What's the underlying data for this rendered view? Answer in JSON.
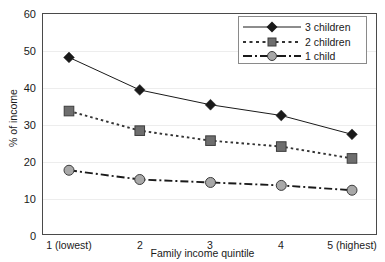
{
  "chart_data": {
    "type": "line",
    "title": "",
    "xlabel": "Family income quintile",
    "ylabel": "% of income",
    "categories": [
      "1 (lowest)",
      "2",
      "3",
      "4",
      "5 (highest)"
    ],
    "ylim": [
      0,
      60
    ],
    "yticks": [
      0,
      10,
      20,
      30,
      40,
      50,
      60
    ],
    "grid": true,
    "legend_position": "top-right",
    "series": [
      {
        "name": "3 children",
        "values": [
          48.0,
          39.2,
          35.2,
          32.3,
          27.2
        ],
        "marker": "diamond",
        "line_style": "solid",
        "color": "#1a1a1a",
        "marker_fill": "#1a1a1a"
      },
      {
        "name": "2 children",
        "values": [
          33.5,
          28.2,
          25.5,
          23.9,
          20.7
        ],
        "marker": "square",
        "line_style": "dotted",
        "color": "#333333",
        "marker_fill": "#6e6e6e"
      },
      {
        "name": "1 child",
        "values": [
          17.5,
          15.0,
          14.2,
          13.4,
          12.1
        ],
        "marker": "circle",
        "line_style": "dash-dot",
        "color": "#1a1a1a",
        "marker_fill": "#a8a8a8"
      }
    ]
  },
  "axis": {
    "y_tick_labels": [
      "60",
      "50",
      "40",
      "30",
      "20",
      "10",
      "0"
    ],
    "y_title": "% of income",
    "x_title": "Family income quintile",
    "x_tick_labels": [
      "1 (lowest)",
      "2",
      "3",
      "4",
      "5 (highest)"
    ]
  },
  "legend": {
    "items": [
      {
        "label": "3 children"
      },
      {
        "label": "2 children"
      },
      {
        "label": "1 child"
      }
    ]
  },
  "colors": {
    "frame": "#4a4a4a",
    "grid": "#ededed",
    "text": "#1a1a1a",
    "legend_border": "#8a8a8a"
  }
}
